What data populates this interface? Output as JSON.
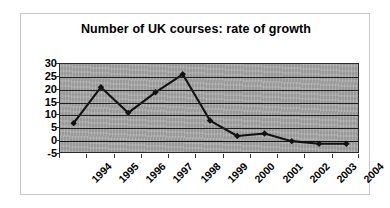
{
  "chart_data": {
    "type": "line",
    "title": "Number of UK courses: rate of growth",
    "xlabel": "",
    "ylabel": "",
    "categories": [
      "1994",
      "1995",
      "1996",
      "1997",
      "1998",
      "1999",
      "2000",
      "2001",
      "2002",
      "2003",
      "2004"
    ],
    "values": [
      7,
      21,
      11,
      19,
      26,
      8,
      2,
      3,
      0,
      -1,
      -1
    ],
    "series": [
      {
        "name": "rate of growth",
        "values": [
          7,
          21,
          11,
          19,
          26,
          8,
          2,
          3,
          0,
          -1,
          -1
        ]
      }
    ],
    "ylim": [
      -5,
      30
    ],
    "ytick_labels": [
      "30",
      "25",
      "20",
      "15",
      "10",
      "5",
      "0",
      "-5"
    ],
    "ytick_values": [
      30,
      25,
      20,
      15,
      10,
      5,
      0,
      -5
    ],
    "grid": true,
    "legend": false,
    "legend_position": "none",
    "marker": "diamond",
    "line_color": "#111111",
    "marker_color": "#111111",
    "plot_background": "#a8a8a8",
    "frame_color": "#c9c9c9"
  }
}
